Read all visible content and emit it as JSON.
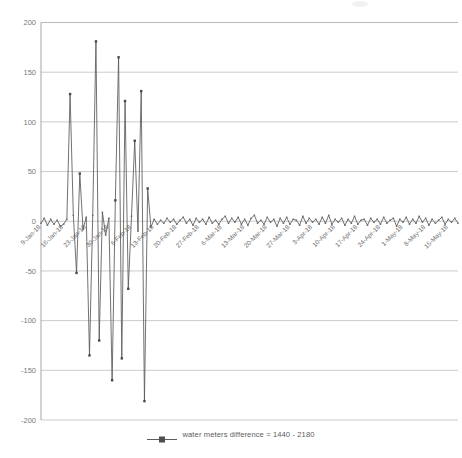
{
  "chart_data": {
    "type": "line",
    "title": "",
    "xlabel": "",
    "ylabel": "",
    "ylim": [
      -200,
      200
    ],
    "ytick_values": [
      200,
      150,
      100,
      50,
      0,
      -50,
      -100,
      -150,
      -200
    ],
    "ytick_labels": [
      "200",
      "150",
      "100",
      "50",
      "0",
      "-50",
      "-100",
      "-150",
      "-200"
    ],
    "grid": true,
    "legend_position": "bottom",
    "series": [
      {
        "name": "water meters difference = 1440 - 2180",
        "color": "#595959",
        "marker": "square",
        "x": [
          "9-Jan-18",
          "10-Jan-18",
          "11-Jan-18",
          "12-Jan-18",
          "13-Jan-18",
          "14-Jan-18",
          "15-Jan-18",
          "16-Jan-18",
          "17-Jan-18",
          "18-Jan-18",
          "19-Jan-18",
          "20-Jan-18",
          "21-Jan-18",
          "22-Jan-18",
          "23-Jan-18",
          "24-Jan-18",
          "25-Jan-18",
          "26-Jan-18",
          "27-Jan-18",
          "28-Jan-18",
          "29-Jan-18",
          "30-Jan-18",
          "31-Jan-18",
          "1-Feb-18",
          "2-Feb-18",
          "3-Feb-18",
          "4-Feb-18",
          "5-Feb-18",
          "6-Feb-18",
          "7-Feb-18",
          "8-Feb-18",
          "9-Feb-18",
          "10-Feb-18",
          "11-Feb-18",
          "12-Feb-18",
          "13-Feb-18",
          "14-Feb-18",
          "15-Feb-18",
          "16-Feb-18",
          "17-Feb-18",
          "18-Feb-18",
          "19-Feb-18",
          "20-Feb-18",
          "21-Feb-18",
          "22-Feb-18",
          "23-Feb-18",
          "24-Feb-18",
          "25-Feb-18",
          "26-Feb-18",
          "27-Feb-18",
          "28-Feb-18",
          "1-Mar-18",
          "2-Mar-18",
          "3-Mar-18",
          "4-Mar-18",
          "5-Mar-18",
          "6-Mar-18",
          "7-Mar-18",
          "8-Mar-18",
          "9-Mar-18",
          "10-Mar-18",
          "11-Mar-18",
          "12-Mar-18",
          "13-Mar-18",
          "14-Mar-18",
          "15-Mar-18",
          "16-Mar-18",
          "17-Mar-18",
          "18-Mar-18",
          "19-Mar-18",
          "20-Mar-18",
          "21-Mar-18",
          "22-Mar-18",
          "23-Mar-18",
          "24-Mar-18",
          "25-Mar-18",
          "26-Mar-18",
          "27-Mar-18",
          "28-Mar-18",
          "29-Mar-18",
          "30-Mar-18",
          "31-Mar-18",
          "1-Apr-18",
          "2-Apr-18",
          "3-Apr-18",
          "4-Apr-18",
          "5-Apr-18",
          "6-Apr-18",
          "7-Apr-18",
          "8-Apr-18",
          "9-Apr-18",
          "10-Apr-18",
          "11-Apr-18",
          "12-Apr-18",
          "13-Apr-18",
          "14-Apr-18",
          "15-Apr-18",
          "16-Apr-18",
          "17-Apr-18",
          "18-Apr-18",
          "19-Apr-18",
          "20-Apr-18",
          "21-Apr-18",
          "22-Apr-18",
          "23-Apr-18",
          "24-Apr-18",
          "25-Apr-18",
          "26-Apr-18",
          "27-Apr-18",
          "28-Apr-18",
          "29-Apr-18",
          "30-Apr-18",
          "1-May-18",
          "2-May-18",
          "3-May-18",
          "4-May-18",
          "5-May-18",
          "6-May-18",
          "7-May-18",
          "8-May-18",
          "9-May-18",
          "10-May-18",
          "11-May-18",
          "12-May-18",
          "13-May-18",
          "14-May-18",
          "15-May-18",
          "16-May-18",
          "17-May-18",
          "18-May-18"
        ],
        "values": [
          -2,
          3,
          -4,
          2,
          -3,
          1,
          -5,
          -3,
          2,
          128,
          6,
          -52,
          48,
          -8,
          4,
          -135,
          6,
          181,
          -120,
          9,
          -14,
          3,
          -160,
          21,
          165,
          -138,
          121,
          -68,
          5,
          81,
          -10,
          131,
          -181,
          33,
          -6,
          2,
          -3,
          1,
          -2,
          3,
          -1,
          2,
          -3,
          1,
          4,
          -2,
          2,
          -4,
          3,
          -1,
          2,
          -3,
          4,
          -2,
          1,
          -3,
          2,
          5,
          -2,
          3,
          -1,
          4,
          -3,
          2,
          -4,
          3,
          6,
          -2,
          1,
          -3,
          4,
          -1,
          2,
          -5,
          3,
          -2,
          4,
          -3,
          2,
          1,
          -4,
          5,
          -2,
          3,
          -1,
          2,
          -3,
          4,
          -2,
          6,
          -3,
          2,
          -1,
          3,
          -4,
          2,
          -2,
          5,
          -3,
          1,
          2,
          -4,
          3,
          -1,
          2,
          -3,
          4,
          -2,
          1,
          3,
          -5,
          2,
          -1,
          4,
          -3,
          2,
          -2,
          5,
          -1,
          3,
          -4,
          2,
          -2,
          1,
          4,
          -3,
          2,
          -1,
          3,
          -2
        ]
      }
    ],
    "xtick_labels": [
      "9-Jan-18",
      "16-Jan-18",
      "23-Jan-18",
      "30-Jan-18",
      "6-Feb-18",
      "13-Feb-18",
      "20-Feb-18",
      "27-Feb-18",
      "6-Mar-18",
      "13-Mar-18",
      "20-Mar-18",
      "27-Mar-18",
      "3-Apr-18",
      "10-Apr-18",
      "17-Apr-18",
      "24-Apr-18",
      "1-May-18",
      "8-May-18",
      "15-May-18"
    ],
    "xtick_indices": [
      0,
      7,
      14,
      21,
      28,
      35,
      42,
      49,
      56,
      63,
      70,
      77,
      84,
      91,
      98,
      105,
      112,
      119,
      126
    ]
  },
  "legend": {
    "label": "water meters difference = 1440 - 2180"
  },
  "colors": {
    "series": "#595959",
    "grid": "#b9b9b9",
    "axis": "#9a9a9a",
    "text": "#6a6a6a"
  }
}
